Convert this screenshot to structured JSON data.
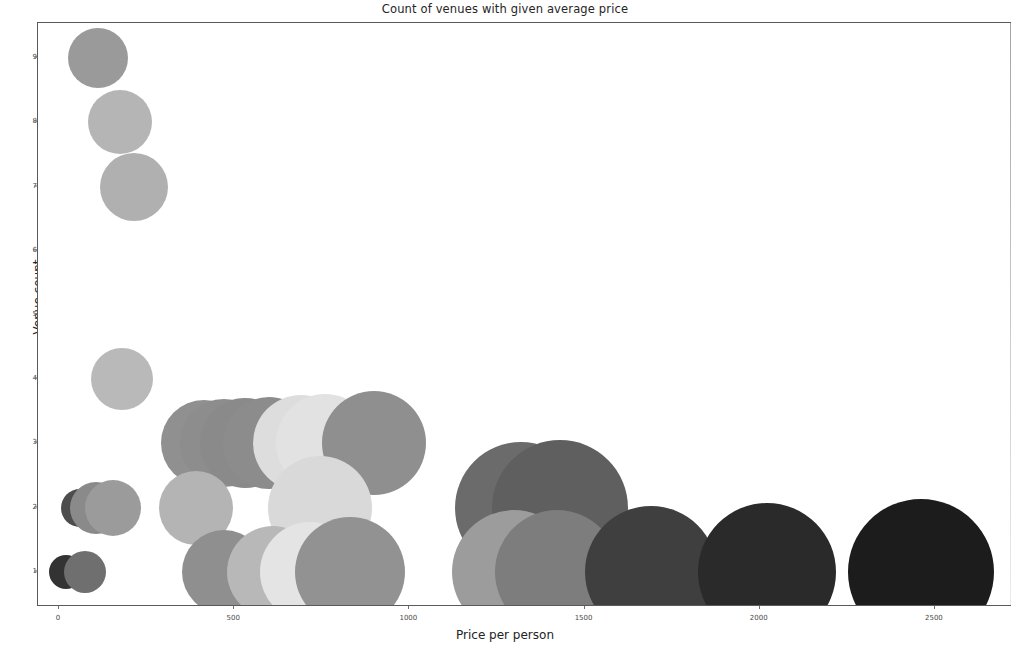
{
  "chart_data": {
    "type": "scatter",
    "title": "Count of venues with given average price",
    "xlabel": "Price per person",
    "ylabel": "Venue count",
    "xlim": [
      -60,
      2720
    ],
    "ylim": [
      0.45,
      9.55
    ],
    "xticks": [
      0,
      500,
      1000,
      1500,
      2000,
      2500
    ],
    "xtick_labels": [
      "0",
      "500",
      "1000",
      "1500",
      "2000",
      "2500"
    ],
    "yticks": [
      1,
      2,
      3,
      4,
      5,
      6,
      7,
      8,
      9
    ],
    "ytick_labels": [
      "1",
      "2",
      "3",
      "4",
      "5",
      "6",
      "7",
      "8",
      "9"
    ],
    "grid": false,
    "legend": false,
    "marker": "circle",
    "size_encodes": "Price per person",
    "color_encodes": "Price per person",
    "note": "Bubble radius and darkness both increase with price per person.",
    "points": [
      {
        "x": 110,
        "y": 9,
        "size": 30,
        "color": "#9a9a9a"
      },
      {
        "x": 175,
        "y": 8,
        "size": 32,
        "color": "#b5b5b5"
      },
      {
        "x": 215,
        "y": 7,
        "size": 34,
        "color": "#b0b0b0"
      },
      {
        "x": 180,
        "y": 4,
        "size": 31,
        "color": "#b9b9b9"
      },
      {
        "x": 415,
        "y": 3,
        "size": 43,
        "color": "#909090"
      },
      {
        "x": 470,
        "y": 3,
        "size": 44,
        "color": "#8d8d8d"
      },
      {
        "x": 530,
        "y": 3,
        "size": 45,
        "color": "#8a8a8a"
      },
      {
        "x": 600,
        "y": 3,
        "size": 46,
        "color": "#8c8c8c"
      },
      {
        "x": 690,
        "y": 3,
        "size": 48,
        "color": "#dddddd"
      },
      {
        "x": 760,
        "y": 3,
        "size": 49,
        "color": "#e2e2e2"
      },
      {
        "x": 900,
        "y": 3,
        "size": 52,
        "color": "#8f8f8f"
      },
      {
        "x": 60,
        "y": 2,
        "size": 19,
        "color": "#4d4d4d"
      },
      {
        "x": 105,
        "y": 2,
        "size": 26,
        "color": "#8a8a8a"
      },
      {
        "x": 155,
        "y": 2,
        "size": 28,
        "color": "#9b9b9b"
      },
      {
        "x": 390,
        "y": 2,
        "size": 37,
        "color": "#b4b4b4"
      },
      {
        "x": 745,
        "y": 2,
        "size": 52,
        "color": "#d9d9d9"
      },
      {
        "x": 1320,
        "y": 2,
        "size": 66,
        "color": "#6b6b6b"
      },
      {
        "x": 1430,
        "y": 2,
        "size": 68,
        "color": "#5f5f5f"
      },
      {
        "x": 20,
        "y": 1,
        "size": 17,
        "color": "#333333"
      },
      {
        "x": 75,
        "y": 1,
        "size": 21,
        "color": "#6f6f6f"
      },
      {
        "x": 470,
        "y": 1,
        "size": 42,
        "color": "#8f8f8f"
      },
      {
        "x": 610,
        "y": 1,
        "size": 46,
        "color": "#b8b8b8"
      },
      {
        "x": 715,
        "y": 1,
        "size": 50,
        "color": "#e4e4e4"
      },
      {
        "x": 830,
        "y": 1,
        "size": 55,
        "color": "#929292"
      },
      {
        "x": 1300,
        "y": 1,
        "size": 62,
        "color": "#9c9c9c"
      },
      {
        "x": 1420,
        "y": 1,
        "size": 62,
        "color": "#7d7d7d"
      },
      {
        "x": 1690,
        "y": 1,
        "size": 66,
        "color": "#3f3f3f"
      },
      {
        "x": 2020,
        "y": 1,
        "size": 69,
        "color": "#2a2a2a"
      },
      {
        "x": 2460,
        "y": 1,
        "size": 73,
        "color": "#1c1c1c"
      }
    ]
  }
}
